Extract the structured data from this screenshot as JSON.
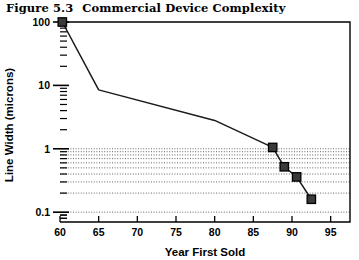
{
  "figure": {
    "number": "Figure 5.3",
    "title": "Commercial Device Complexity"
  },
  "chart_data": {
    "type": "line",
    "title": "Commercial Device Complexity",
    "xlabel": "Year First Sold",
    "ylabel": "Line Width (microns)",
    "xlim": [
      60,
      97.5
    ],
    "ylim": [
      0.07,
      100
    ],
    "yscale": "log",
    "xscale": "linear",
    "xticks": [
      60,
      65,
      70,
      75,
      80,
      85,
      90,
      95
    ],
    "xtick_labels": [
      "60",
      "65",
      "70",
      "75",
      "80",
      "85",
      "90",
      "95"
    ],
    "yticks": [
      100,
      10,
      1,
      0.1
    ],
    "ytick_labels": [
      "100",
      "10",
      "1",
      "0.1"
    ],
    "grid": "horizontal-dotted-minor-lower-decades",
    "legend": "none",
    "series": [
      {
        "name": "Line Width",
        "marker": "filled-square",
        "x": [
          60.3,
          65.0,
          80.0,
          87.5,
          89.0,
          90.6,
          92.5
        ],
        "y": [
          100,
          8.5,
          2.8,
          1.05,
          0.52,
          0.36,
          0.16
        ],
        "marker_at": [
          true,
          false,
          false,
          true,
          true,
          true,
          true
        ]
      }
    ]
  }
}
